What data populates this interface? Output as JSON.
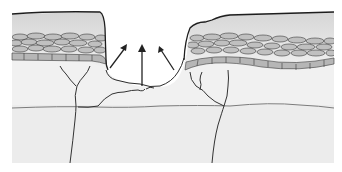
{
  "diagram": {
    "type": "skin-wound-cross-section",
    "labels": [],
    "colors": {
      "background": "#ffffff",
      "dermis": "#efefef",
      "dermis_lower": "#ebebeb",
      "epidermis_top": "#d9d9d9",
      "epidermis_bottom": "#f0f0f0",
      "cells_fill": "#bdbdbd",
      "basal_fill": "#b4b4b4",
      "outline": "#2b2b2b",
      "nerve": "#333333",
      "boundary_line": "#7a7a7a",
      "arrow": "#222222"
    },
    "elements": {
      "left_skin_flap": "Epidermis with stratified cells on left side of wound",
      "right_skin_flap": "Epidermis with stratified cells on right side of wound",
      "wound_bed": "Central crater between skin flaps",
      "arrows": [
        "up-left",
        "up",
        "up-right"
      ],
      "nerve_fibers": 4,
      "dermis_boundary": "Wavy horizontal line across lower dermis"
    }
  }
}
